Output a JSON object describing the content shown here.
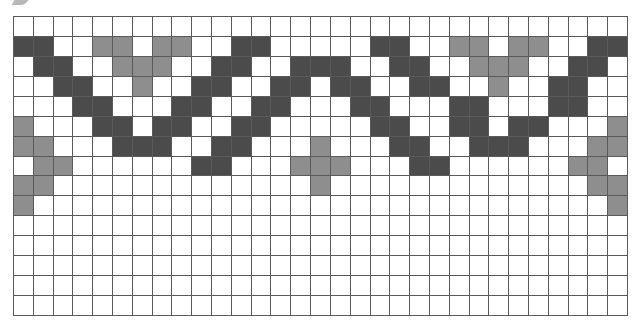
{
  "pattern": {
    "columns": 31,
    "rows": 15,
    "legend": {
      "D": "dark",
      "L": "light",
      "W": "white"
    },
    "colors": {
      "dark": "#4b4b4b",
      "light": "#8e8e8e",
      "white": "#ffffff",
      "gridline": "#5a5a5a"
    },
    "grid": [
      "WWWWWWWWWWWWWWWWWWWWWWWWWWWWWWW",
      "DDWWLLWLLWWDDWWWWWDDWWLLWLLWWDD",
      "WDDWWLLLWWDDWWDDDWWDDWWLLLWWDDW",
      "WWDDWWLWWDDWWDDWDDWWDDWWLWWDDWW",
      "WWWDDWWWDDWWDDWWWDDWWWDDWWWDDWWW",
      "LWWWDDWDDWWDDWWWWWDDWWDDWDDWWWL",
      "LLWWWDDDWWDDWWWLWWWDDWWDDDWWWLL",
      "WLLWWWWWWDDWWWLLLWWWDDWWWWWWLLW",
      "LLWWWWWWWWWWWWWLWWWWWWWWWWWWWLL",
      "LWWWWWWWWWWWWWWWWWWWWWWWWWWWWWL",
      "WWWWWWWWWWWWWWWWWWWWWWWWWWWWWWW",
      "WWWWWWWWWWWWWWWWWWWWWWWWWWWWWWW",
      "WWWWWWWWWWWWWWWWWWWWWWWWWWWWWWW",
      "WWWWWWWWWWWWWWWWWWWWWWWWWWWWWWW",
      "WWWWWWWWWWWWWWWWWWWWWWWWWWWWWWW"
    ]
  }
}
